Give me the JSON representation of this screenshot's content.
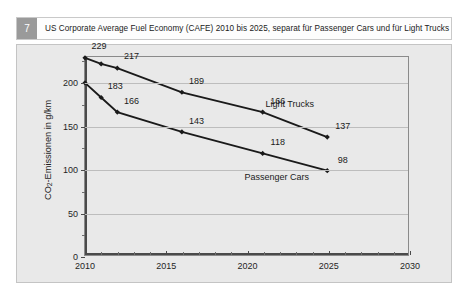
{
  "header": {
    "badge": "7",
    "title": "US Corporate Average Fuel Economy (CAFE) 2010 bis 2025, separat für Passenger Cars und für Light Trucks"
  },
  "chart_data": {
    "type": "line",
    "title": "US Corporate Average Fuel Economy (CAFE) 2010 bis 2025, separat für Passenger Cars und für Light Trucks",
    "xlabel": "",
    "ylabel": "CO2-Emissionen in g/km",
    "ylabel_prefix": "CO",
    "ylabel_sub": "2",
    "ylabel_suffix": "-Emissionen in g/km",
    "x": [
      2010,
      2011,
      2012,
      2016,
      2021,
      2025
    ],
    "xlim": [
      2010,
      2030
    ],
    "ylim": [
      0,
      230
    ],
    "xticks": [
      2010,
      2015,
      2020,
      2025,
      2030
    ],
    "xtick_labels": [
      "2010",
      "2015",
      "2020",
      "2025",
      "2030"
    ],
    "xminor_step": 1,
    "yticks": [
      0,
      50,
      100,
      150,
      200
    ],
    "ytick_labels": [
      "0",
      "50",
      "100",
      "150",
      "200"
    ],
    "yminor": [
      25,
      75,
      125,
      175,
      225
    ],
    "grid": "horizontal",
    "legend_position": "inline-annotation",
    "line_color": "#1a1a1a",
    "marker": "diamond",
    "series": [
      {
        "name": "Light Trucks",
        "values": [
          229,
          222,
          217,
          189,
          166,
          137
        ],
        "labels": [
          "229",
          "217",
          "189",
          "166",
          "137"
        ],
        "label_points": [
          2010,
          2012,
          2016,
          2021,
          2025
        ],
        "name_x": 2022.6,
        "name_y": 176
      },
      {
        "name": "Passenger Cars",
        "values": [
          200,
          183,
          166,
          143,
          118,
          98
        ],
        "labels": [
          "183",
          "166",
          "143",
          "118",
          "98"
        ],
        "label_points": [
          2011,
          2012,
          2016,
          2021,
          2025
        ],
        "name_x": 2021.8,
        "name_y": 92
      }
    ]
  }
}
